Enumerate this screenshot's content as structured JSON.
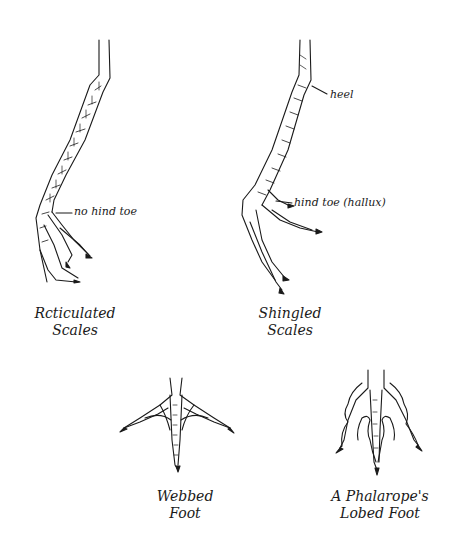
{
  "figures": [
    {
      "id": "reticulated",
      "caption": [
        "Rcticulated",
        "Scales"
      ],
      "callouts": [
        "no hind toe"
      ]
    },
    {
      "id": "shingled",
      "caption": [
        "Shingled",
        "Scales"
      ],
      "callouts": [
        "heel",
        "hind toe (hallux)"
      ]
    },
    {
      "id": "webbed",
      "caption": [
        "Webbed",
        "Foot"
      ],
      "callouts": []
    },
    {
      "id": "lobed",
      "caption": [
        "A Phalarope's",
        "Lobed Foot"
      ],
      "callouts": []
    }
  ],
  "colors": {
    "ink": "#1a1a1a",
    "background": "#ffffff"
  }
}
